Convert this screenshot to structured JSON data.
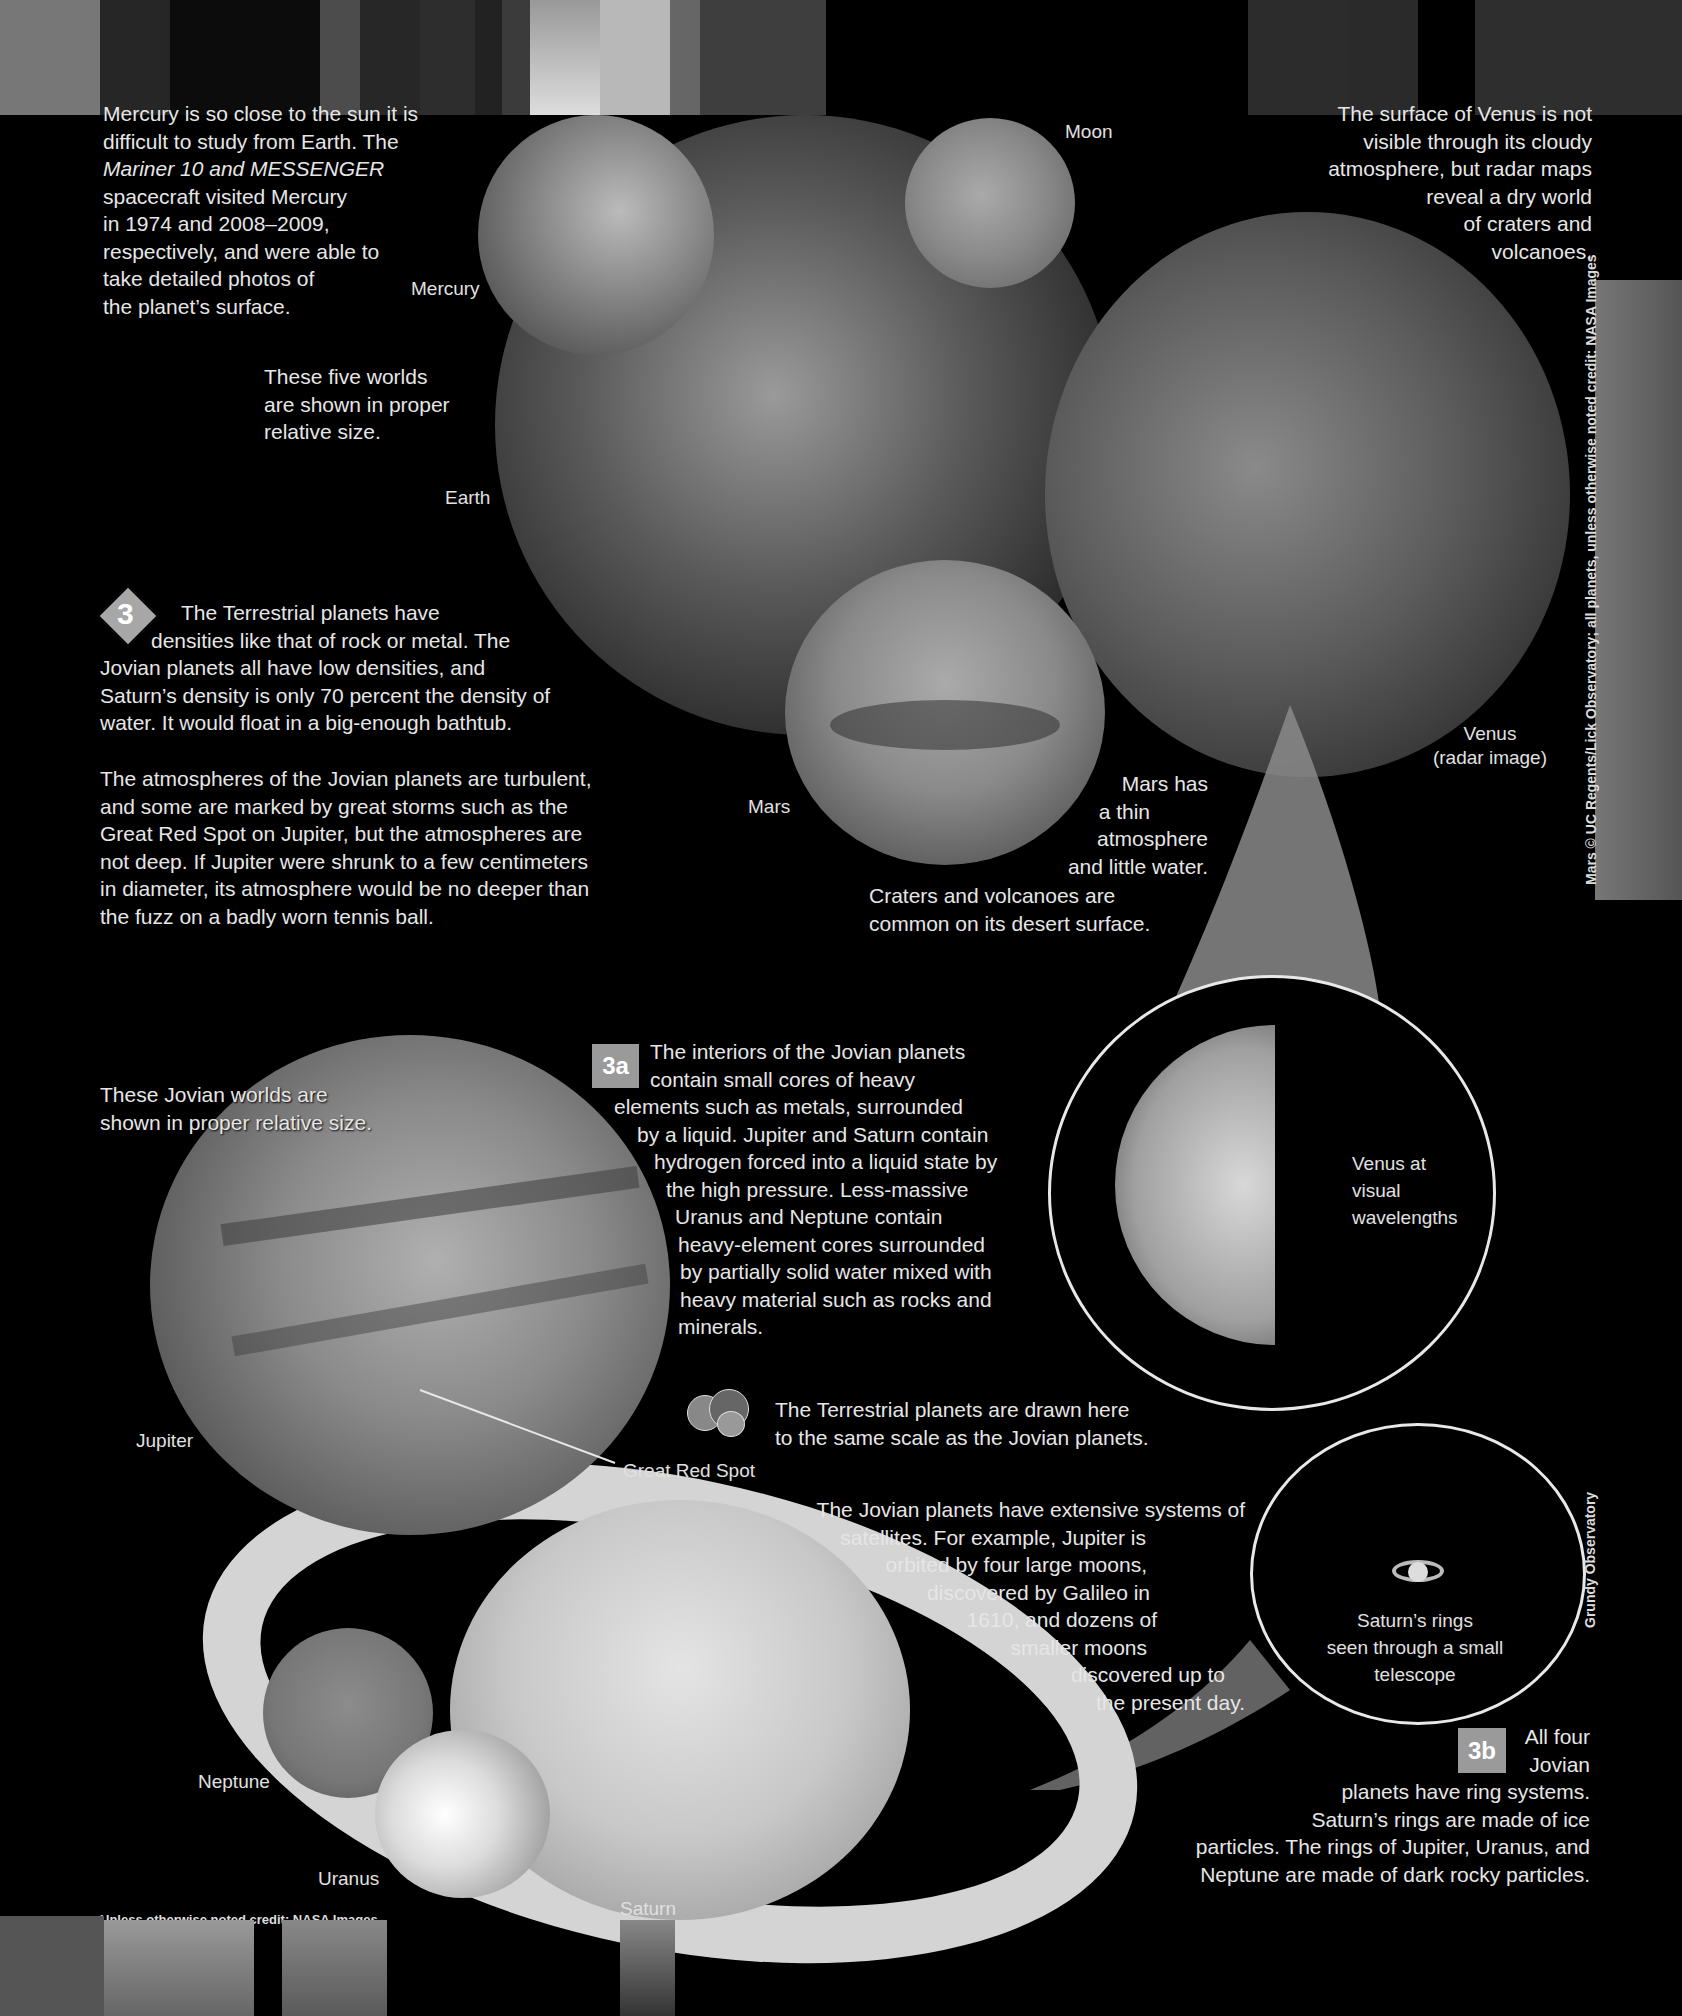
{
  "mercury_note": {
    "lines": [
      "Mercury is so close to the sun it is",
      "difficult to study from Earth. The",
      "Mariner 10 and MESSENGER",
      "spacecraft visited Mercury",
      "in 1974 and 2008–2009,",
      "respectively, and were able to",
      "take detailed photos of",
      "the planet’s surface."
    ]
  },
  "venus_note": {
    "lines": [
      "The surface of Venus is not",
      "visible through its cloudy",
      "atmosphere, but radar maps",
      "reveal a dry world",
      "of craters and",
      "volcanoes."
    ]
  },
  "five_worlds_note": {
    "lines": [
      "These five worlds",
      "are shown in proper",
      "relative size."
    ]
  },
  "planet_labels": {
    "mercury": "Mercury",
    "moon": "Moon",
    "earth": "Earth",
    "mars": "Mars",
    "venus": "Venus",
    "venus_sub": "(radar image)",
    "jupiter": "Jupiter",
    "great_red_spot": "Great Red Spot",
    "neptune": "Neptune",
    "uranus": "Uranus",
    "saturn": "Saturn"
  },
  "section3": {
    "badge": "3",
    "para1": [
      "The Terrestrial planets have",
      "densities like that of rock or metal. The",
      "Jovian planets all have low densities, and",
      "Saturn’s density is only 70 percent the density of",
      "water. It would float in a big-enough bathtub."
    ],
    "para2": [
      "The atmospheres of the Jovian planets are turbulent,",
      "and some are marked by great storms such as the",
      "Great Red Spot on Jupiter, but the atmospheres are",
      "not deep. If Jupiter were shrunk to a few centimeters",
      "in diameter, its atmosphere would be no deeper than",
      "the fuzz on a badly worn tennis ball."
    ]
  },
  "mars_note": {
    "lines": [
      "Mars has",
      "a thin",
      "atmosphere",
      "and little water.",
      "Craters and volcanoes are",
      "common on its desert surface."
    ]
  },
  "jovian_worlds_note": {
    "lines": [
      "These Jovian worlds are",
      "shown in proper relative size."
    ]
  },
  "section3a": {
    "badge": "3a",
    "lines": [
      "The interiors of the Jovian planets",
      "contain small cores of heavy",
      "elements such as metals, surrounded",
      "by a liquid. Jupiter and Saturn contain",
      "hydrogen forced into a liquid state by",
      "the high pressure. Less-massive",
      "Uranus and Neptune contain",
      "heavy-element cores surrounded",
      "by partially solid water mixed with",
      "heavy material such as rocks and",
      "minerals."
    ]
  },
  "venus_visual": {
    "lines": [
      "Venus at",
      "visual",
      "wavelengths"
    ]
  },
  "scale_note": {
    "lines": [
      "The Terrestrial planets are drawn here",
      "to the same scale as the Jovian planets."
    ]
  },
  "satellites_note": {
    "lines": [
      "The Jovian planets have extensive systems of",
      "satellites. For example, Jupiter is",
      "orbited by four large moons,",
      "discovered by Galileo in",
      "1610, and dozens of",
      "smaller moons",
      "discovered up to",
      "the present day."
    ]
  },
  "saturn_telescope": {
    "lines": [
      "Saturn’s rings",
      "seen through a small",
      "telescope"
    ]
  },
  "section3b": {
    "badge": "3b",
    "lines": [
      "All four",
      "Jovian",
      "planets have ring systems.",
      "Saturn’s rings are made of ice",
      "particles. The rings of Jupiter, Uranus, and",
      "Neptune are made of dark rocky particles."
    ]
  },
  "credits": {
    "right_vertical": "Mars © UC Regents/Lick Observatory; all planets, unless otherwise noted credit: NASA Images",
    "grundy": "Grundy Observatory",
    "bottom": "Unless otherwise noted credit: NASA Images"
  }
}
